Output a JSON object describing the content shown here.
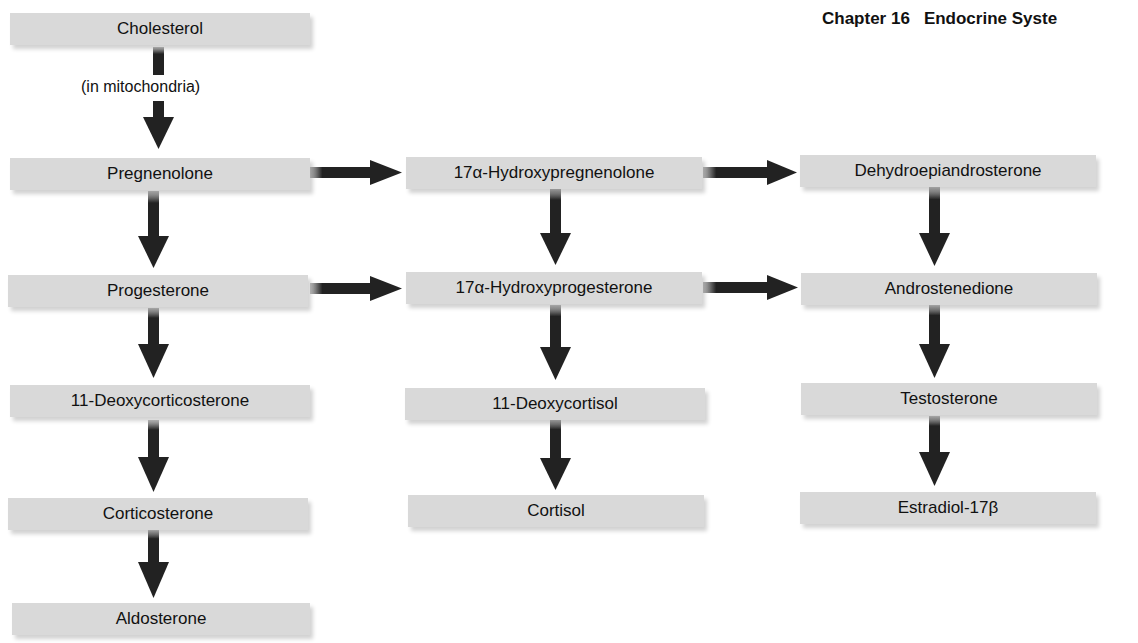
{
  "header": {
    "chapter": "Chapter 16",
    "title": "Endocrine Syste"
  },
  "diagram": {
    "type": "steroid biosynthesis pathway",
    "note": "(in mitochondria)",
    "nodes": {
      "cholesterol": "Cholesterol",
      "pregnenolone": "Pregnenolone",
      "progesterone": "Progesterone",
      "deoxycorticosterone": "11-Deoxycorticosterone",
      "corticosterone": "Corticosterone",
      "aldosterone": "Aldosterone",
      "hydroxypregnenolone": "17α-Hydroxypregnenolone",
      "hydroxyprogesterone": "17α-Hydroxyprogesterone",
      "deoxycortisol": "11-Deoxycortisol",
      "cortisol": "Cortisol",
      "dhea": "Dehydroepiandrosterone",
      "androstenedione": "Androstenedione",
      "testosterone": "Testosterone",
      "estradiol": "Estradiol-17β"
    },
    "edges": [
      [
        "Cholesterol",
        "Pregnenolone"
      ],
      [
        "Pregnenolone",
        "Progesterone"
      ],
      [
        "Progesterone",
        "11-Deoxycorticosterone"
      ],
      [
        "11-Deoxycorticosterone",
        "Corticosterone"
      ],
      [
        "Corticosterone",
        "Aldosterone"
      ],
      [
        "Pregnenolone",
        "17α-Hydroxypregnenolone"
      ],
      [
        "Progesterone",
        "17α-Hydroxyprogesterone"
      ],
      [
        "17α-Hydroxypregnenolone",
        "17α-Hydroxyprogesterone"
      ],
      [
        "17α-Hydroxyprogesterone",
        "11-Deoxycortisol"
      ],
      [
        "11-Deoxycortisol",
        "Cortisol"
      ],
      [
        "17α-Hydroxypregnenolone",
        "Dehydroepiandrosterone"
      ],
      [
        "17α-Hydroxyprogesterone",
        "Androstenedione"
      ],
      [
        "Dehydroepiandrosterone",
        "Androstenedione"
      ],
      [
        "Androstenedione",
        "Testosterone"
      ],
      [
        "Testosterone",
        "Estradiol-17β"
      ]
    ]
  },
  "colors": {
    "box": "#d9d9d9",
    "arrow": "#222222",
    "text": "#111111"
  }
}
